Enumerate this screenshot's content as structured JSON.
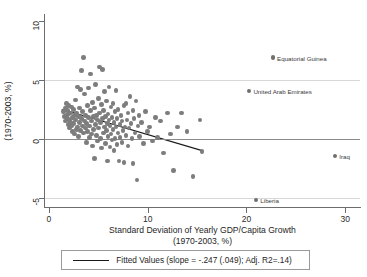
{
  "chart_data": {
    "type": "scatter",
    "title": "",
    "xlabel": "Standard Deviation of Yearly GDP/Capita Growth (1970-2003, %)",
    "xlabel_line1": "Standard Deviation of Yearly GDP/Capita Growth",
    "xlabel_line2": "(1970-2003, %)",
    "ylabel": "(1970-2003, %)",
    "xlim": [
      -0.4,
      31.5
    ],
    "ylim": [
      -5.8,
      10.6
    ],
    "xticks": [
      0,
      10,
      20,
      30
    ],
    "yticks": [
      10,
      5,
      0,
      -5
    ],
    "xtick_labels": [
      "0",
      "10",
      "20",
      "30"
    ],
    "ytick_labels": [
      "10",
      "5",
      "0",
      "-5"
    ],
    "grid": "horizontal-faint",
    "gridlines_y": [
      5,
      -5
    ],
    "zero_line_y": 0,
    "marker_color": "#7d7d7d",
    "line_color": "#1a1a1a",
    "legend_position": "below-axis",
    "legend": [
      {
        "label": "Fitted Values (slope = -.247 (.049); Adj. R2=.14)",
        "kind": "line"
      }
    ],
    "fit": {
      "slope": -0.247,
      "slope_se": 0.049,
      "adj_r2": 0.14,
      "intercept": 2.82,
      "x_start": 1.3,
      "x_end": 15.6,
      "y_start": 2.5,
      "y_end": -1.03
    },
    "annotations": [
      {
        "label": "Equatorial Guinea",
        "x": 22.7,
        "y": 6.9
      },
      {
        "label": "United Arab Emirates",
        "x": 20.3,
        "y": 4.05
      },
      {
        "label": "Iraq",
        "x": 29.0,
        "y": -1.5
      },
      {
        "label": "Liberia",
        "x": 21.0,
        "y": -5.2
      }
    ],
    "points": [
      [
        1.5,
        2.3
      ],
      [
        1.6,
        1.9
      ],
      [
        1.7,
        2.6
      ],
      [
        1.7,
        1.5
      ],
      [
        1.8,
        2.0
      ],
      [
        1.8,
        3.0
      ],
      [
        1.9,
        1.7
      ],
      [
        1.9,
        2.4
      ],
      [
        2.0,
        1.2
      ],
      [
        2.0,
        2.1
      ],
      [
        2.0,
        2.8
      ],
      [
        2.1,
        1.6
      ],
      [
        2.1,
        0.9
      ],
      [
        2.2,
        2.2
      ],
      [
        2.2,
        1.4
      ],
      [
        2.3,
        2.7
      ],
      [
        2.3,
        1.1
      ],
      [
        2.4,
        1.8
      ],
      [
        2.4,
        0.6
      ],
      [
        2.5,
        2.5
      ],
      [
        2.5,
        1.3
      ],
      [
        2.6,
        2.0
      ],
      [
        2.6,
        0.4
      ],
      [
        2.7,
        1.6
      ],
      [
        2.7,
        3.3
      ],
      [
        2.8,
        2.2
      ],
      [
        2.8,
        0.8
      ],
      [
        2.9,
        1.0
      ],
      [
        2.9,
        4.4
      ],
      [
        3.0,
        1.9
      ],
      [
        3.0,
        0.2
      ],
      [
        3.1,
        2.6
      ],
      [
        3.1,
        1.4
      ],
      [
        3.2,
        0.7
      ],
      [
        3.2,
        4.2
      ],
      [
        3.3,
        1.7
      ],
      [
        3.3,
        5.8
      ],
      [
        3.4,
        1.1
      ],
      [
        3.4,
        2.3
      ],
      [
        3.5,
        0.5
      ],
      [
        3.5,
        6.9
      ],
      [
        3.6,
        1.5
      ],
      [
        3.6,
        3.8
      ],
      [
        3.7,
        0.9
      ],
      [
        3.7,
        2.0
      ],
      [
        3.8,
        1.3
      ],
      [
        3.8,
        -0.3
      ],
      [
        3.9,
        2.8
      ],
      [
        3.9,
        0.6
      ],
      [
        4.0,
        1.8
      ],
      [
        4.0,
        4.3
      ],
      [
        4.1,
        1.1
      ],
      [
        4.1,
        0.1
      ],
      [
        4.2,
        2.4
      ],
      [
        4.2,
        5.5
      ],
      [
        4.3,
        1.5
      ],
      [
        4.3,
        0.4
      ],
      [
        4.4,
        3.1
      ],
      [
        4.4,
        -0.6
      ],
      [
        4.5,
        1.9
      ],
      [
        4.5,
        0.8
      ],
      [
        4.6,
        2.6
      ],
      [
        4.6,
        -1.7
      ],
      [
        4.7,
        1.2
      ],
      [
        4.7,
        4.6
      ],
      [
        4.8,
        0.3
      ],
      [
        4.8,
        2.0
      ],
      [
        4.9,
        1.6
      ],
      [
        4.9,
        -0.2
      ],
      [
        5.0,
        3.4
      ],
      [
        5.0,
        0.9
      ],
      [
        5.1,
        2.2
      ],
      [
        5.1,
        6.1
      ],
      [
        5.2,
        1.4
      ],
      [
        5.2,
        0.0
      ],
      [
        5.3,
        2.9
      ],
      [
        5.3,
        -0.8
      ],
      [
        5.4,
        1.7
      ],
      [
        5.4,
        5.9
      ],
      [
        5.5,
        0.5
      ],
      [
        5.5,
        2.4
      ],
      [
        5.6,
        1.0
      ],
      [
        5.6,
        4.0
      ],
      [
        5.7,
        -0.4
      ],
      [
        5.7,
        1.9
      ],
      [
        5.8,
        0.7
      ],
      [
        5.8,
        3.2
      ],
      [
        5.9,
        1.3
      ],
      [
        5.9,
        -1.9
      ],
      [
        6.0,
        2.1
      ],
      [
        6.0,
        0.2
      ],
      [
        6.1,
        1.6
      ],
      [
        6.1,
        4.4
      ],
      [
        6.2,
        -0.7
      ],
      [
        6.2,
        1.1
      ],
      [
        6.3,
        2.7
      ],
      [
        6.3,
        0.4
      ],
      [
        6.4,
        1.8
      ],
      [
        6.4,
        -0.1
      ],
      [
        6.5,
        3.0
      ],
      [
        6.5,
        0.8
      ],
      [
        6.6,
        1.4
      ],
      [
        6.6,
        -1.0
      ],
      [
        6.7,
        2.3
      ],
      [
        6.7,
        0.0
      ],
      [
        6.8,
        1.0
      ],
      [
        6.8,
        4.1
      ],
      [
        6.9,
        -0.5
      ],
      [
        6.9,
        1.7
      ],
      [
        7.0,
        0.5
      ],
      [
        7.0,
        2.5
      ],
      [
        7.1,
        -1.9
      ],
      [
        7.2,
        1.2
      ],
      [
        7.2,
        0.1
      ],
      [
        7.3,
        2.0
      ],
      [
        7.4,
        -0.3
      ],
      [
        7.4,
        1.5
      ],
      [
        7.5,
        0.7
      ],
      [
        7.6,
        2.8
      ],
      [
        7.6,
        -2.0
      ],
      [
        7.7,
        1.0
      ],
      [
        7.8,
        0.3
      ],
      [
        7.8,
        3.0
      ],
      [
        7.9,
        1.6
      ],
      [
        8.0,
        -0.6
      ],
      [
        8.0,
        2.2
      ],
      [
        8.1,
        0.9
      ],
      [
        8.2,
        3.6
      ],
      [
        8.3,
        1.3
      ],
      [
        8.4,
        0.0
      ],
      [
        8.5,
        2.4
      ],
      [
        8.5,
        -2.1
      ],
      [
        8.6,
        1.7
      ],
      [
        8.7,
        0.5
      ],
      [
        8.8,
        3.2
      ],
      [
        8.9,
        -3.5
      ],
      [
        9.0,
        1.1
      ],
      [
        9.1,
        2.0
      ],
      [
        9.2,
        0.2
      ],
      [
        9.4,
        1.4
      ],
      [
        9.6,
        -0.4
      ],
      [
        9.8,
        2.3
      ],
      [
        10.0,
        0.6
      ],
      [
        10.2,
        1.0
      ],
      [
        10.5,
        -0.2
      ],
      [
        10.8,
        1.8
      ],
      [
        11.0,
        0.1
      ],
      [
        11.3,
        1.5
      ],
      [
        11.6,
        -1.2
      ],
      [
        12.0,
        2.2
      ],
      [
        12.3,
        0.4
      ],
      [
        12.6,
        -2.7
      ],
      [
        13.0,
        1.0
      ],
      [
        13.4,
        2.2
      ],
      [
        14.0,
        0.6
      ],
      [
        14.6,
        -3.2
      ],
      [
        15.3,
        1.6
      ],
      [
        15.5,
        -1.1
      ]
    ]
  }
}
